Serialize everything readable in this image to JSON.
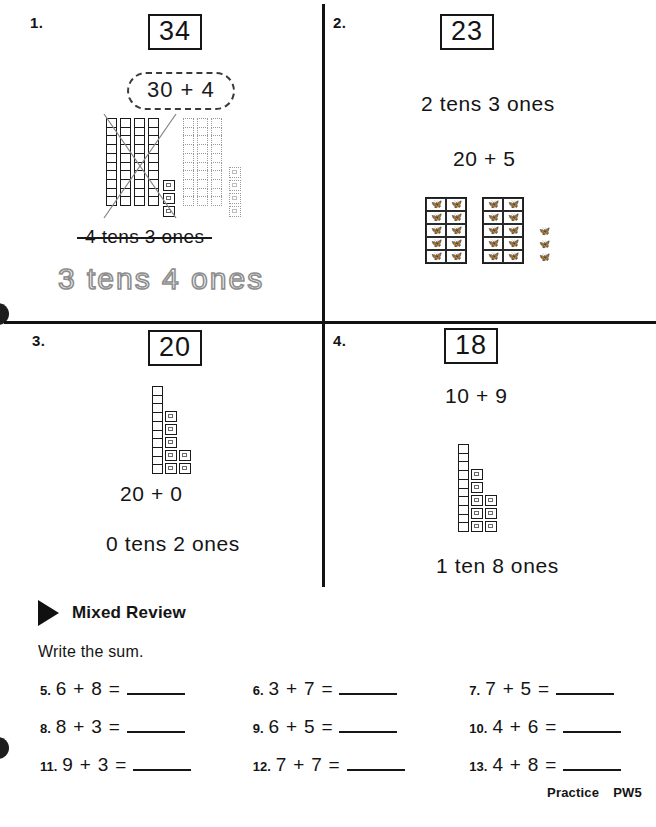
{
  "worksheet": {
    "problems": [
      {
        "number": "1.",
        "numeral": "34",
        "expression_oval": "30 + 4",
        "printed_answer_struck": "4 tens 3 ones",
        "traced_answer": "3 tens 4 ones",
        "blocks": {
          "solid_rods": 4,
          "solid_cubes": 3,
          "dotted_rods": 3,
          "dotted_cubes": 4,
          "crossed_out": "true"
        }
      },
      {
        "number": "2.",
        "numeral": "23",
        "line1": "2 tens 3 ones",
        "line2": "20 + 5",
        "stamps": {
          "groups": 2,
          "rows": 5,
          "cols": 2,
          "loose": 3,
          "glyph": "bug-stamp"
        }
      },
      {
        "number": "3.",
        "numeral": "20",
        "line1": "20 + 0",
        "line2": "0 tens 2 ones",
        "blocks": {
          "rods": 1,
          "cubes_col1": 5,
          "cubes_col2": 2
        }
      },
      {
        "number": "4.",
        "numeral": "18",
        "line1": "10 + 9",
        "line2": "1 ten 8 ones",
        "blocks": {
          "rods": 1,
          "cubes_col1": 5,
          "cubes_col2": 3
        }
      }
    ]
  },
  "mixed_review": {
    "title": "Mixed Review",
    "instruction": "Write the sum.",
    "items": [
      {
        "n": "5.",
        "q": "6 + 8 ="
      },
      {
        "n": "6.",
        "q": "3 + 7 ="
      },
      {
        "n": "7.",
        "q": "7 + 5 ="
      },
      {
        "n": "8.",
        "q": "8 + 3 ="
      },
      {
        "n": "9.",
        "q": "6 + 5 ="
      },
      {
        "n": "10.",
        "q": "4 + 6 ="
      },
      {
        "n": "11.",
        "q": "9 + 3 ="
      },
      {
        "n": "12.",
        "q": "7 + 7 ="
      },
      {
        "n": "13.",
        "q": "4 + 8 ="
      }
    ]
  },
  "footer": {
    "label": "Practice",
    "page": "PW5"
  }
}
